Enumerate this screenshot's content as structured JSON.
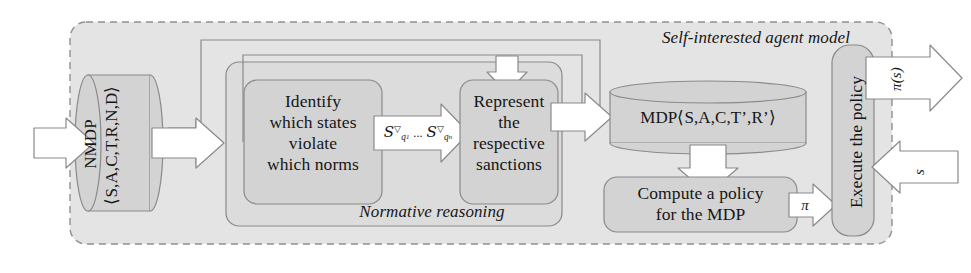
{
  "figure": {
    "type": "flow-diagram",
    "outer_group_label": "Self-interested agent model",
    "inner_group_label": "Normative reasoning"
  },
  "nodes": {
    "nmdp": {
      "shape": "cylinder",
      "line1": "NMDP",
      "line2": "⟨S,A,C,T,R,N,D⟩",
      "orientation": "vertical"
    },
    "identify": {
      "shape": "rounded-box",
      "line1": "Identify",
      "line2": "which states",
      "line3": "violate",
      "line4": "which norms"
    },
    "represent": {
      "shape": "rounded-box",
      "line1": "Represent",
      "line2": "the",
      "line3": "respective",
      "line4": "sanctions"
    },
    "mdp": {
      "shape": "cylinder",
      "text": "MDP⟨S,A,C,T’,R’⟩"
    },
    "compute": {
      "shape": "rounded-box",
      "line1": "Compute a policy",
      "line2": "for the MDP"
    },
    "execute": {
      "shape": "rounded-box",
      "text": "Execute the policy",
      "orientation": "vertical"
    }
  },
  "edges": {
    "input_arrow": {
      "label": "",
      "direction": "right"
    },
    "nmdp_to_identify": {
      "label": "",
      "direction": "right"
    },
    "identify_to_represent": {
      "label_s1": "S",
      "label_nabla1": "▽",
      "label_sub1": "q",
      "label_sub1_idx": "1",
      "label_dots": "...",
      "label_s2": "S",
      "label_nabla2": "▽",
      "label_sub2": "q",
      "label_sub2_idx": "n",
      "direction": "right"
    },
    "represent_to_mdp": {
      "label": "",
      "direction": "right"
    },
    "mdp_to_compute": {
      "label": "",
      "direction": "down"
    },
    "compute_to_execute": {
      "label": "π",
      "direction": "right"
    },
    "execute_out": {
      "label": "π(s)",
      "direction": "right"
    },
    "state_in": {
      "label": "s",
      "direction": "left"
    },
    "feedback_outer": {
      "label": "",
      "direction": "loop-to-identify"
    },
    "feedback_inner": {
      "label": "",
      "direction": "loop-to-represent"
    }
  },
  "colors": {
    "page_background": "#ffffff",
    "outer_panel_fill": "#e4e4e4",
    "inner_panel_fill": "#dcdcdc",
    "node_fill": "#d3d3d3",
    "arrow_fill": "#ffffff",
    "stroke": "#8a8a8a",
    "dashed_border": "#8f8f8f",
    "text": "#161616"
  }
}
